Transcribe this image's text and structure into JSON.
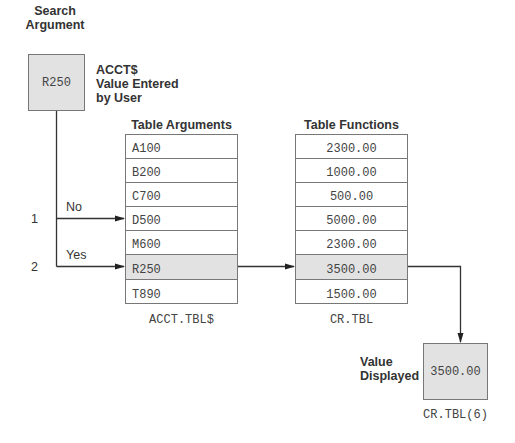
{
  "search": {
    "title_line1": "Search",
    "title_line2": "Argument",
    "value": "R250",
    "note_line1": "ACCT$",
    "note_line2": "Value Entered",
    "note_line3": "by User"
  },
  "arguments_table": {
    "header": "Table Arguments",
    "rows": [
      "A100",
      "B200",
      "C700",
      "D500",
      "M600",
      "R250",
      "T890"
    ],
    "highlight_index": 5,
    "caption": "ACCT.TBL$"
  },
  "functions_table": {
    "header": "Table Functions",
    "rows": [
      "2300.00",
      "1000.00",
      "500.00",
      "5000.00",
      "2300.00",
      "3500.00",
      "1500.00"
    ],
    "highlight_index": 5,
    "caption": "CR.TBL"
  },
  "steps": [
    {
      "number": "1",
      "label": "No"
    },
    {
      "number": "2",
      "label": "Yes"
    }
  ],
  "result": {
    "label_line1": "Value",
    "label_line2": "Displayed",
    "value": "3500.00",
    "caption": "CR.TBL(6)"
  },
  "colors": {
    "highlight_fill": "#e2e2e2",
    "line": "#333333",
    "border": "#777777"
  }
}
